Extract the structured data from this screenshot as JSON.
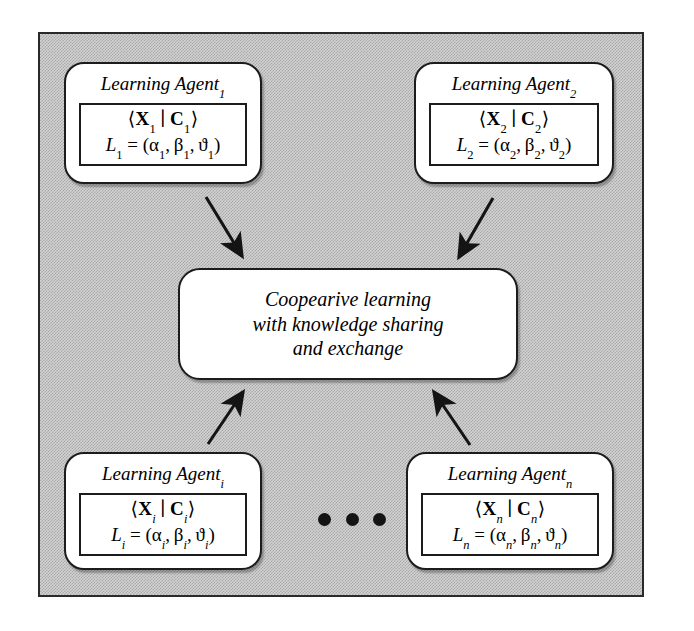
{
  "diagram": {
    "background_color": "#d2d2d2",
    "frame_border_color": "#2a2a2a",
    "box_fill_color": "#ffffff",
    "box_border_color": "#1c1c1c",
    "arrow_color": "#141414"
  },
  "agents": [
    {
      "id": "agent-1",
      "title": "Learning Agent",
      "subscript": "1",
      "tuple": "⟨X₁ | C₁⟩",
      "tuple_x": "X",
      "tuple_c": "C",
      "tuple_sub": "1",
      "params_label": "L",
      "params_sub": "1",
      "params": "= (α₁, β₁, ϑ₁)",
      "alpha": "α",
      "beta": "β",
      "theta": "ϑ",
      "position": "top-left"
    },
    {
      "id": "agent-2",
      "title": "Learning Agent",
      "subscript": "2",
      "tuple": "⟨X₂ | C₂⟩",
      "tuple_x": "X",
      "tuple_c": "C",
      "tuple_sub": "2",
      "params_label": "L",
      "params_sub": "2",
      "params": "= (α₂, β₂, ϑ₂)",
      "alpha": "α",
      "beta": "β",
      "theta": "ϑ",
      "position": "top-right"
    },
    {
      "id": "agent-i",
      "title": "Learning Agent",
      "subscript": "i",
      "tuple": "⟨Xᵢ | Cᵢ⟩",
      "tuple_x": "X",
      "tuple_c": "C",
      "tuple_sub": "i",
      "params_label": "L",
      "params_sub": "i",
      "params": "= (αᵢ, βᵢ, ϑᵢ)",
      "alpha": "α",
      "beta": "β",
      "theta": "ϑ",
      "position": "bottom-left"
    },
    {
      "id": "agent-n",
      "title": "Learning Agent",
      "subscript": "n",
      "tuple": "⟨Xₙ | Cₙ⟩",
      "tuple_x": "X",
      "tuple_c": "C",
      "tuple_sub": "n",
      "params_label": "L",
      "params_sub": "n",
      "params": "= (αₙ, βₙ, ϑₙ)",
      "alpha": "α",
      "beta": "β",
      "theta": "ϑ",
      "position": "bottom-right"
    }
  ],
  "center": {
    "id": "cooperative-learning",
    "line1": "Coopearive learning",
    "line2": "with knowledge sharing",
    "line3": "and exchange"
  },
  "ellipsis": {
    "glyph": "•",
    "count": 3,
    "meaning": "additional agents omitted"
  },
  "arrows": [
    {
      "id": "arrow-agent1-to-center",
      "from": "agent-1",
      "to": "cooperative-learning",
      "direction": "down-right"
    },
    {
      "id": "arrow-agent2-to-center",
      "from": "agent-2",
      "to": "cooperative-learning",
      "direction": "down-left"
    },
    {
      "id": "arrow-agenti-to-center",
      "from": "agent-i",
      "to": "cooperative-learning",
      "direction": "up-right"
    },
    {
      "id": "arrow-agentn-to-center",
      "from": "agent-n",
      "to": "cooperative-learning",
      "direction": "up-left"
    }
  ],
  "symbols": {
    "angle_open": "⟨",
    "angle_close": "⟩",
    "bar": "∣"
  }
}
